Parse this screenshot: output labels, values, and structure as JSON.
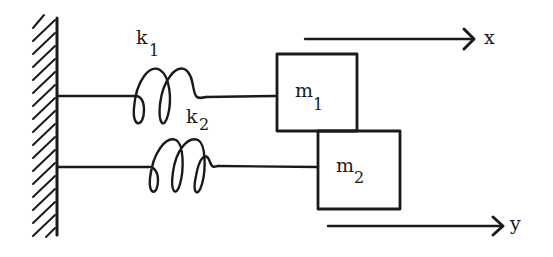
{
  "diagram": {
    "type": "mass-spring system",
    "colors": {
      "stroke": "#1a1a1a",
      "background": "#ffffff"
    },
    "springs": [
      {
        "id": "k1",
        "label": "k",
        "subscript": "1"
      },
      {
        "id": "k2",
        "label": "k",
        "subscript": "2"
      }
    ],
    "masses": [
      {
        "id": "m1",
        "label": "m",
        "subscript": "1"
      },
      {
        "id": "m2",
        "label": "m",
        "subscript": "2"
      }
    ],
    "displacements": [
      {
        "id": "x",
        "label": "x"
      },
      {
        "id": "y",
        "label": "y"
      }
    ],
    "wall": {
      "label": "fixed wall"
    }
  }
}
